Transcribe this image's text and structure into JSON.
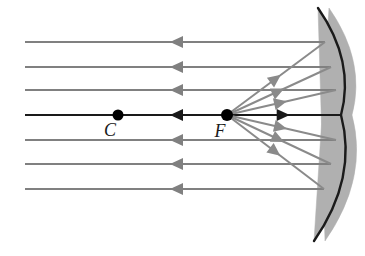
{
  "figure": {
    "width": 365,
    "height": 256,
    "background": "#ffffff"
  },
  "colors": {
    "incoming_ray": "#808080",
    "reflected_ray": "#8a8a8a",
    "axis_ray": "#1a1a1a",
    "mirror_surface": "#1a1a1a",
    "mirror_body": "#b0b0b0",
    "point_marker": "#000000",
    "label_text": "#1a1a1a"
  },
  "labels": {
    "center_of_curvature": "C",
    "focal_point": "F"
  },
  "points": [
    {
      "name": "center-of-curvature",
      "label": "C",
      "x": 118,
      "y": 115,
      "radius": 5.5,
      "label_x": 110,
      "label_y": 136
    },
    {
      "name": "focal-point",
      "label": "F",
      "x": 227,
      "y": 115,
      "radius": 6,
      "label_x": 220,
      "label_y": 137
    }
  ],
  "mirror": {
    "name": "concave-mirror",
    "vertex_x": 341,
    "vertex_y": 115,
    "top_x": 318,
    "top_y": 8,
    "bottom_x": 314,
    "bottom_y": 241,
    "thickness": 11,
    "surface_side": "left"
  },
  "axis": {
    "name": "principal-axis",
    "y": 115,
    "x_start": 25,
    "x_end": 341
  },
  "incoming_rays": [
    {
      "y": 42,
      "x_start": 25,
      "x_end": 325,
      "arrow_x": 170,
      "direction": "left"
    },
    {
      "y": 67,
      "x_start": 25,
      "x_end": 331,
      "arrow_x": 170,
      "direction": "left"
    },
    {
      "y": 90,
      "x_start": 25,
      "x_end": 336,
      "arrow_x": 170,
      "direction": "left"
    },
    {
      "y": 115,
      "x_start": 25,
      "x_end": 341,
      "arrow_x": 170,
      "direction": "left"
    },
    {
      "y": 140,
      "x_start": 25,
      "x_end": 336,
      "arrow_x": 170,
      "direction": "left"
    },
    {
      "y": 164,
      "x_start": 25,
      "x_end": 331,
      "arrow_x": 170,
      "direction": "left"
    },
    {
      "y": 189,
      "x_start": 25,
      "x_end": 324,
      "arrow_x": 170,
      "direction": "left"
    }
  ],
  "reflected_rays": [
    {
      "from_x": 227,
      "from_y": 115,
      "to_x": 325,
      "to_y": 42,
      "arrow_t": 0.55,
      "direction": "to-mirror"
    },
    {
      "from_x": 227,
      "from_y": 115,
      "to_x": 331,
      "to_y": 67,
      "arrow_t": 0.55,
      "direction": "to-mirror"
    },
    {
      "from_x": 227,
      "from_y": 115,
      "to_x": 336,
      "to_y": 90,
      "arrow_t": 0.55,
      "direction": "to-mirror"
    },
    {
      "from_x": 227,
      "from_y": 115,
      "to_x": 341,
      "to_y": 115,
      "arrow_t": 0.55,
      "direction": "to-mirror"
    },
    {
      "from_x": 227,
      "from_y": 115,
      "to_x": 336,
      "to_y": 140,
      "arrow_t": 0.55,
      "direction": "to-mirror"
    },
    {
      "from_x": 227,
      "from_y": 115,
      "to_x": 331,
      "to_y": 164,
      "arrow_t": 0.55,
      "direction": "to-mirror"
    },
    {
      "from_x": 227,
      "from_y": 115,
      "to_x": 324,
      "to_y": 189,
      "arrow_t": 0.55,
      "direction": "to-mirror"
    }
  ]
}
